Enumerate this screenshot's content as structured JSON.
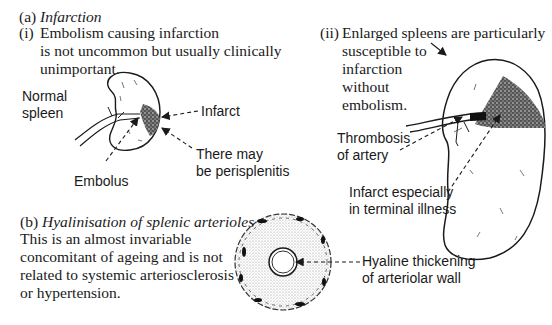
{
  "section_a": {
    "label": "(a)",
    "title": "Infarction",
    "item_i": {
      "label": "(i)",
      "lines": [
        "Embolism causing infarction",
        "is not uncommon but usually clinically",
        "unimportant."
      ]
    },
    "item_ii": {
      "label": "(ii)",
      "lines": [
        "Enlarged spleens are particularly",
        "susceptible to",
        "infarction",
        "without",
        "embolism."
      ]
    },
    "figure_i_labels": {
      "normal_spleen": [
        "Normal",
        "spleen"
      ],
      "infarct": "Infarct",
      "perisplenitis": [
        "There may",
        "be perisplenitis"
      ],
      "embolus": "Embolus"
    },
    "figure_ii_labels": {
      "thrombosis": [
        "Thrombosis",
        "of artery"
      ],
      "infarct_terminal": [
        "Infarct especially",
        "in terminal illness"
      ]
    }
  },
  "section_b": {
    "label": "(b)",
    "title": "Hyalinisation of splenic arterioles",
    "lines": [
      "This is an almost invariable",
      "concomitant of ageing and is not",
      "related to systemic arteriosclerosis",
      "or hypertension."
    ],
    "figure_labels": {
      "hyaline": [
        "Hyaline thickening",
        "of arteriolar wall"
      ]
    }
  },
  "colors": {
    "ink": "#1a1a1a",
    "background": "#ffffff"
  }
}
